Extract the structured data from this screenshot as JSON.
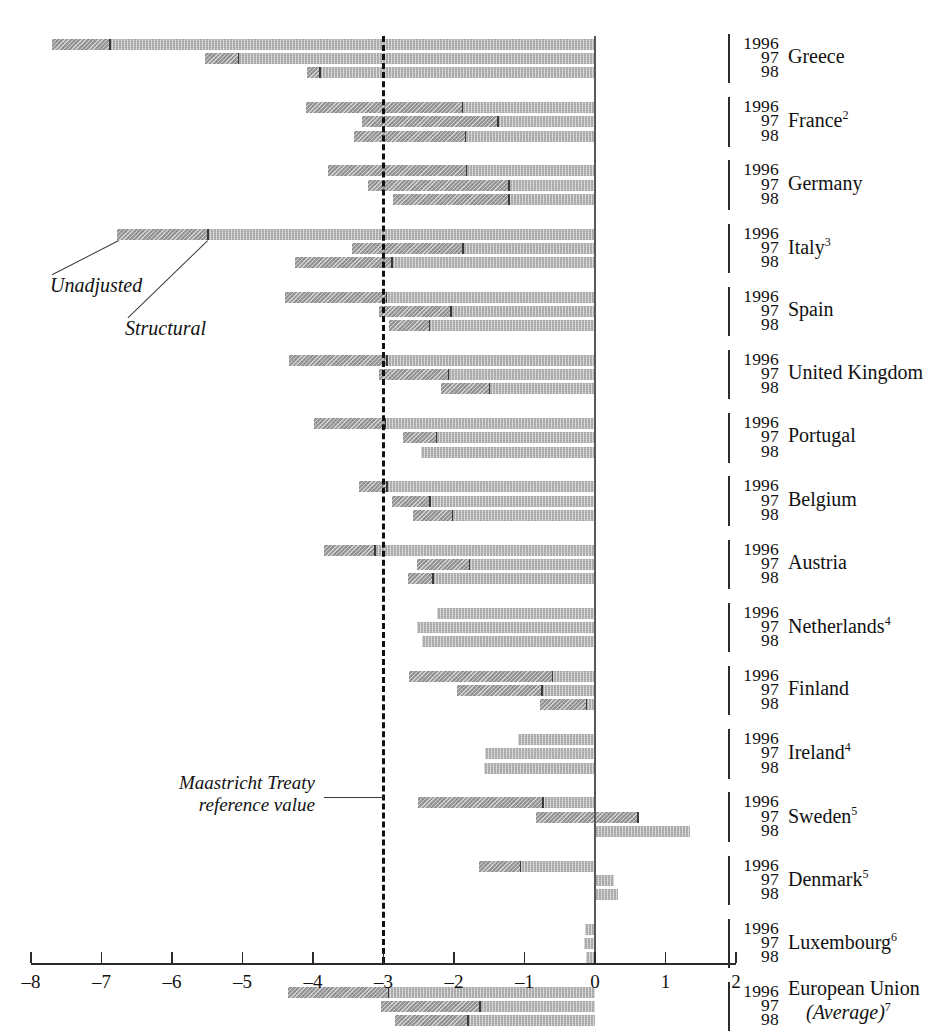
{
  "chart_data": {
    "type": "bar",
    "orientation": "horizontal",
    "title": "",
    "xlabel": "",
    "ylabel": "",
    "xlim": [
      -8,
      2
    ],
    "xticks": [
      -8,
      -7,
      -6,
      -5,
      -4,
      -3,
      -2,
      -1,
      0,
      1,
      2
    ],
    "xtick_labels": [
      "–8",
      "–7",
      "–6",
      "–5",
      "–4",
      "–3",
      "–2",
      "–1",
      "0",
      "1",
      "2"
    ],
    "grid": false,
    "legend_position": "inline-annotation",
    "series": [
      {
        "name": "Structural",
        "color": "#9b9b9b"
      },
      {
        "name": "Unadjusted",
        "color": "#b4b4b4"
      }
    ],
    "reference_line": {
      "value": -3,
      "label": "Maastricht Treaty reference value",
      "style": "dashed"
    },
    "year_labels": [
      "1996",
      "97",
      "98"
    ],
    "groups": [
      {
        "country": "Greece",
        "footnote": "",
        "rows": [
          {
            "year": "1996",
            "unadjusted": -7.7,
            "structural": -6.88
          },
          {
            "year": "97",
            "unadjusted": -5.53,
            "structural": -5.06
          },
          {
            "year": "98",
            "unadjusted": -4.08,
            "structural": -3.9
          }
        ]
      },
      {
        "country": "France",
        "footnote": "2",
        "rows": [
          {
            "year": "1996",
            "unadjusted": -4.1,
            "structural": -1.88
          },
          {
            "year": "97",
            "unadjusted": -3.3,
            "structural": -1.38
          },
          {
            "year": "98",
            "unadjusted": -3.42,
            "structural": -1.84
          }
        ]
      },
      {
        "country": "Germany",
        "footnote": "",
        "rows": [
          {
            "year": "1996",
            "unadjusted": -3.79,
            "structural": -1.82
          },
          {
            "year": "97",
            "unadjusted": -3.22,
            "structural": -1.22
          },
          {
            "year": "98",
            "unadjusted": -2.87,
            "structural": -1.22
          }
        ]
      },
      {
        "country": "Italy",
        "footnote": "3",
        "rows": [
          {
            "year": "1996",
            "unadjusted": -6.78,
            "structural": -5.49
          },
          {
            "year": "97",
            "unadjusted": -3.45,
            "structural": -1.87
          },
          {
            "year": "98",
            "unadjusted": -4.26,
            "structural": -2.88
          }
        ]
      },
      {
        "country": "Spain",
        "footnote": "",
        "rows": [
          {
            "year": "1996",
            "unadjusted": -4.4,
            "structural": -2.96
          },
          {
            "year": "97",
            "unadjusted": -3.06,
            "structural": -2.04
          },
          {
            "year": "98",
            "unadjusted": -2.92,
            "structural": -2.35
          }
        ]
      },
      {
        "country": "United Kingdom",
        "footnote": "",
        "rows": [
          {
            "year": "1996",
            "unadjusted": -4.34,
            "structural": -2.95
          },
          {
            "year": "97",
            "unadjusted": -3.06,
            "structural": -2.08
          },
          {
            "year": "98",
            "unadjusted": -2.18,
            "structural": -1.5
          }
        ]
      },
      {
        "country": "Portugal",
        "footnote": "",
        "rows": [
          {
            "year": "1996",
            "unadjusted": -3.98,
            "structural": -2.97
          },
          {
            "year": "97",
            "unadjusted": -2.72,
            "structural": -2.25
          },
          {
            "year": "98",
            "unadjusted": -2.47,
            "structural": -2.47
          }
        ]
      },
      {
        "country": "Belgium",
        "footnote": "",
        "rows": [
          {
            "year": "1996",
            "unadjusted": -3.35,
            "structural": -2.95
          },
          {
            "year": "97",
            "unadjusted": -2.88,
            "structural": -2.34
          },
          {
            "year": "98",
            "unadjusted": -2.58,
            "structural": -2.02
          }
        ]
      },
      {
        "country": "Austria",
        "footnote": "",
        "rows": [
          {
            "year": "1996",
            "unadjusted": -3.85,
            "structural": -3.12
          },
          {
            "year": "97",
            "unadjusted": -2.52,
            "structural": -1.78
          },
          {
            "year": "98",
            "unadjusted": -2.65,
            "structural": -2.3
          }
        ]
      },
      {
        "country": "Netherlands",
        "footnote": "4",
        "rows": [
          {
            "year": "1996",
            "unadjusted": -2.24,
            "structural": -2.24
          },
          {
            "year": "97",
            "unadjusted": -2.53,
            "structural": -2.53
          },
          {
            "year": "98",
            "unadjusted": -2.46,
            "structural": -2.46
          }
        ]
      },
      {
        "country": "Finland",
        "footnote": "",
        "rows": [
          {
            "year": "1996",
            "unadjusted": -2.64,
            "structural": -0.6
          },
          {
            "year": "97",
            "unadjusted": -1.96,
            "structural": -0.75
          },
          {
            "year": "98",
            "unadjusted": -0.78,
            "structural": -0.12
          }
        ]
      },
      {
        "country": "Ireland",
        "footnote": "4",
        "rows": [
          {
            "year": "1996",
            "unadjusted": -1.09,
            "structural": -1.09
          },
          {
            "year": "97",
            "unadjusted": -1.56,
            "structural": -1.56
          },
          {
            "year": "98",
            "unadjusted": -1.58,
            "structural": -1.58
          }
        ]
      },
      {
        "country": "Sweden",
        "footnote": "5",
        "rows": [
          {
            "year": "1996",
            "unadjusted": -2.51,
            "structural": -0.74
          },
          {
            "year": "97",
            "unadjusted": -0.84,
            "structural": 0.61
          },
          {
            "year": "98",
            "unadjusted": 1.35,
            "structural": 1.35
          }
        ]
      },
      {
        "country": "Denmark",
        "footnote": "5",
        "rows": [
          {
            "year": "1996",
            "unadjusted": -1.64,
            "structural": -1.06
          },
          {
            "year": "97",
            "unadjusted": 0.27,
            "structural": 0.27
          },
          {
            "year": "98",
            "unadjusted": 0.32,
            "structural": 0.32
          }
        ]
      },
      {
        "country": "Luxembourg",
        "footnote": "6",
        "rows": [
          {
            "year": "1996",
            "unadjusted": -0.14,
            "structural": -0.14
          },
          {
            "year": "97",
            "unadjusted": -0.16,
            "structural": -0.16
          },
          {
            "year": "98",
            "unadjusted": -0.13,
            "structural": -0.13
          }
        ]
      },
      {
        "country": "European Union",
        "footnote": "7",
        "subtitle": "(Average)",
        "rows": [
          {
            "year": "1996",
            "unadjusted": -4.36,
            "structural": -2.93
          },
          {
            "year": "97",
            "unadjusted": -3.03,
            "structural": -1.63
          },
          {
            "year": "98",
            "unadjusted": -2.84,
            "structural": -1.8
          }
        ]
      }
    ],
    "annotations": [
      {
        "id": "unadjusted",
        "text": "Unadjusted"
      },
      {
        "id": "structural",
        "text": "Structural"
      },
      {
        "id": "maastricht",
        "line1": "Maastricht Treaty",
        "line2": "reference value"
      }
    ]
  }
}
